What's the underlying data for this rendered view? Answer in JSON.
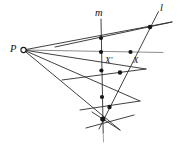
{
  "figure": {
    "kind": "projective-geometry-perspectivity-diagram",
    "width": 187,
    "height": 150,
    "background_color": "#ffffff",
    "stroke_color": "#2b2b2b",
    "faint_stroke_color": "#8a8a8a",
    "point_color": "#171717"
  },
  "labels": {
    "center": "P",
    "line_m": "m",
    "line_l": "l",
    "point_x_prime": "X′",
    "point_x": "X"
  },
  "points": {
    "P": {
      "label": "P",
      "x": 23.5,
      "y": 50.0,
      "style": "open-circle"
    },
    "A1": {
      "label": "",
      "x": 101.0,
      "y": 38.0,
      "style": "filled"
    },
    "X_prime": {
      "label": "X′",
      "x": 101.0,
      "y": 52.0,
      "style": "filled"
    },
    "A3": {
      "label": "",
      "x": 101.0,
      "y": 70.5,
      "style": "filled"
    },
    "A4": {
      "label": "",
      "x": 101.0,
      "y": 97.0,
      "style": "filled"
    },
    "A5": {
      "label": "",
      "x": 102.5,
      "y": 119.0,
      "style": "filled"
    },
    "B1": {
      "label": "",
      "x": 150.0,
      "y": 27.0,
      "style": "filled"
    },
    "X": {
      "label": "X",
      "x": 130.5,
      "y": 52.0,
      "style": "filled"
    },
    "B3": {
      "label": "",
      "x": 120.0,
      "y": 72.5,
      "style": "filled"
    },
    "B4": {
      "label": "",
      "x": 109.0,
      "y": 107.0,
      "style": "filled"
    }
  },
  "lines": {
    "m": {
      "name": "m",
      "x1": 101.0,
      "y1": 19.0,
      "x2": 103.5,
      "y2": 140.0,
      "label_x": 97.5,
      "label_y": 17.0
    },
    "l": {
      "name": "l",
      "x1": 158.5,
      "y1": 11.5,
      "x2": 99.0,
      "y2": 129.0,
      "label_x": 162.0,
      "label_y": 11.0
    },
    "ray_axis": {
      "name": "ray-through-X",
      "x1": 23.5,
      "y1": 50.0,
      "x2": 163.0,
      "y2": 52.5
    },
    "ray_1": {
      "name": "ray-1",
      "x1": 23.5,
      "y1": 50.0,
      "x2": 150.0,
      "y2": 27.0
    },
    "ray_3": {
      "name": "ray-3",
      "x1": 23.5,
      "y1": 50.0,
      "x2": 120.0,
      "y2": 72.5
    },
    "ray_4": {
      "name": "ray-4",
      "x1": 23.5,
      "y1": 50.0,
      "x2": 109.0,
      "y2": 107.0
    },
    "ray_5": {
      "name": "ray-5",
      "x1": 23.5,
      "y1": 50.0,
      "x2": 103.0,
      "y2": 119.0
    },
    "transversal_1": {
      "name": "transversal-1",
      "x1": 55.0,
      "y1": 47.0,
      "x2": 172.0,
      "y2": 22.0
    },
    "transversal_2": {
      "name": "transversal-2",
      "x1": 62.0,
      "y1": 80.0,
      "x2": 146.0,
      "y2": 69.0
    },
    "transversal_3": {
      "name": "transversal-3",
      "x1": 80.0,
      "y1": 110.0,
      "x2": 140.0,
      "y2": 101.0
    },
    "transversal_4": {
      "name": "transversal-4",
      "x1": 86.0,
      "y1": 128.0,
      "x2": 134.0,
      "y2": 115.0
    },
    "cross_short": {
      "name": "cross-segment",
      "x1": 92.0,
      "y1": 112.0,
      "x2": 120.0,
      "y2": 130.0
    }
  }
}
